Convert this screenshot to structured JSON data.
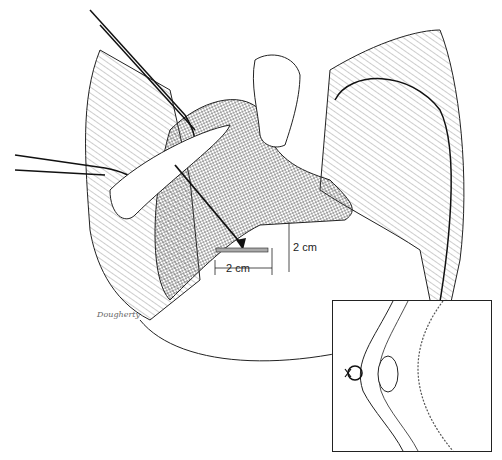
{
  "illustration": {
    "subject": "surgical anatomy illustration with clamps and suture",
    "dimension_labels": {
      "width": "2 cm",
      "height": "2 cm"
    },
    "signature": "Dougherty",
    "inset": {
      "subject": "cross-section detail with suture knot"
    },
    "ink_color": "#1a1a1a",
    "background_color": "#ffffff"
  }
}
